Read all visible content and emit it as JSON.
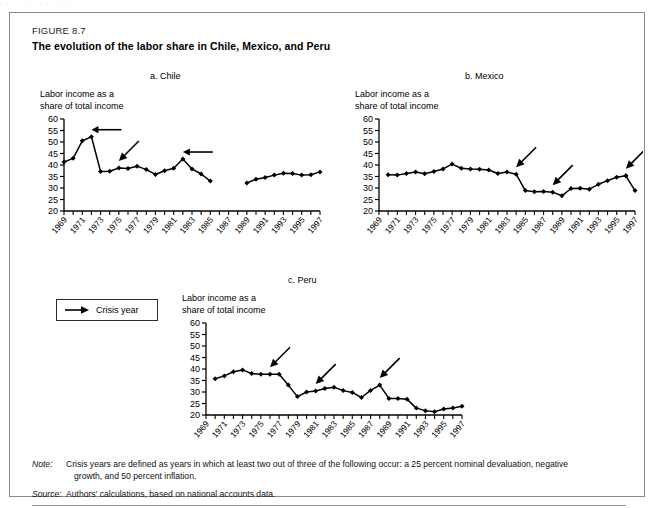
{
  "top_bleed_text": "·  ·  ·   ·   ·    ·      ·          ·                ·        ·     ·   ·  ·  ·",
  "figure": {
    "number_label": "FIGURE 8.7",
    "title": "The evolution of the labor share in Chile, Mexico, and Peru"
  },
  "axis_caption_line1": "Labor income as a",
  "axis_caption_line2": "share of total income",
  "legend": {
    "arrow_icon": "right-arrow-icon",
    "label": "Crisis year"
  },
  "notes": {
    "note_lead": "Note:",
    "note_text": "Crisis years are defined as years in which at least two out of three of the following occur: a 25 percent nominal devaluation, negative",
    "note_text_cont": "growth, and 50 percent inflation.",
    "source_lead": "Source:",
    "source_text": "Authors' calculations, based on national accounts data."
  },
  "chart_data": [
    {
      "type": "line",
      "title": "a. Chile",
      "xlabel": "",
      "ylabel": "Labor income as a share of total income",
      "ylim": [
        20,
        60
      ],
      "yticks": [
        20,
        25,
        30,
        35,
        40,
        45,
        50,
        55,
        60
      ],
      "xlim": [
        1969,
        1997
      ],
      "xticks": [
        1969,
        1970,
        1971,
        1972,
        1973,
        1974,
        1975,
        1976,
        1977,
        1978,
        1979,
        1980,
        1981,
        1982,
        1983,
        1984,
        1985,
        1986,
        1987,
        1988,
        1989,
        1990,
        1991,
        1992,
        1993,
        1994,
        1995,
        1996,
        1997
      ],
      "xticklabels": [
        "1969",
        "1971",
        "1973",
        "1975",
        "1977",
        "1979",
        "1981",
        "1983",
        "1985",
        "1987",
        "1989",
        "1991",
        "1993",
        "1995",
        "1997"
      ],
      "grid": false,
      "legend_position": "none",
      "marker": "diamond",
      "segments": [
        {
          "x": [
            1969,
            1970,
            1971,
            1972,
            1973,
            1974,
            1975,
            1976,
            1977,
            1978,
            1979,
            1980,
            1981,
            1982,
            1983,
            1984,
            1985
          ],
          "y": [
            41.3,
            42.9,
            50.5,
            52.3,
            37.2,
            37.3,
            38.7,
            38.5,
            39.5,
            38.0,
            35.9,
            37.5,
            38.6,
            42.6,
            38.3,
            36.1,
            33.0
          ]
        },
        {
          "x": [
            1989,
            1990,
            1991,
            1992,
            1993,
            1994,
            1995,
            1996,
            1997
          ],
          "y": [
            32.2,
            33.8,
            34.6,
            35.6,
            36.4,
            36.3,
            35.6,
            35.8,
            37.0
          ]
        }
      ],
      "annotations": [
        {
          "label": "crisis-year-arrow",
          "year": 1972,
          "style": "horizontal"
        },
        {
          "label": "crisis-year-arrow",
          "year": 1975,
          "style": "diagonal"
        },
        {
          "label": "crisis-year-arrow",
          "year": 1982,
          "style": "horizontal"
        }
      ]
    },
    {
      "type": "line",
      "title": "b. Mexico",
      "xlabel": "",
      "ylabel": "Labor income as a share of total income",
      "ylim": [
        20,
        60
      ],
      "yticks": [
        20,
        25,
        30,
        35,
        40,
        45,
        50,
        55,
        60
      ],
      "xlim": [
        1969,
        1997
      ],
      "xticklabels": [
        "1969",
        "1971",
        "1973",
        "1975",
        "1977",
        "1979",
        "1981",
        "1983",
        "1985",
        "1987",
        "1989",
        "1991",
        "1993",
        "1995",
        "1997"
      ],
      "grid": false,
      "legend_position": "none",
      "marker": "diamond",
      "segments": [
        {
          "x": [
            1970,
            1971,
            1972,
            1973,
            1974,
            1975,
            1976,
            1977,
            1978,
            1979,
            1980,
            1981,
            1982,
            1983,
            1984,
            1985,
            1986,
            1987,
            1988,
            1989,
            1990,
            1991,
            1992,
            1993,
            1994,
            1995,
            1996
          ],
          "y": [
            35.8,
            35.6,
            36.3,
            37.0,
            36.2,
            37.2,
            38.3,
            40.4,
            38.6,
            38.3,
            38.2,
            37.8,
            36.3,
            37.0,
            36.0,
            28.9,
            28.4,
            28.5,
            28.2,
            26.6,
            29.8,
            29.9,
            29.5,
            31.6,
            33.2,
            34.7,
            35.3
          ]
        },
        {
          "x": [
            1996,
            1997
          ],
          "y": [
            35.3,
            28.9
          ]
        }
      ],
      "annotations": [
        {
          "label": "crisis-year-arrow",
          "year": 1984,
          "style": "diagonal"
        },
        {
          "label": "crisis-year-arrow",
          "year": 1988,
          "style": "diagonal"
        },
        {
          "label": "crisis-year-arrow",
          "year": 1996,
          "style": "diagonal"
        }
      ]
    },
    {
      "type": "line",
      "title": "c. Peru",
      "xlabel": "",
      "ylabel": "Labor income as a share of total income",
      "ylim": [
        20,
        60
      ],
      "yticks": [
        20,
        25,
        30,
        35,
        40,
        45,
        50,
        55,
        60
      ],
      "xlim": [
        1969,
        1997
      ],
      "xticklabels": [
        "1969",
        "1971",
        "1973",
        "1975",
        "1977",
        "1979",
        "1981",
        "1983",
        "1985",
        "1987",
        "1989",
        "1991",
        "1993",
        "1995",
        "1997"
      ],
      "grid": false,
      "legend_position": "none",
      "marker": "diamond",
      "segments": [
        {
          "x": [
            1970,
            1971,
            1972,
            1973,
            1974,
            1975,
            1976,
            1977,
            1978,
            1979,
            1980,
            1981,
            1982,
            1983,
            1984,
            1985,
            1986,
            1987,
            1988,
            1989,
            1990,
            1991,
            1992,
            1993,
            1994,
            1995,
            1996,
            1997
          ],
          "y": [
            35.8,
            37.0,
            38.8,
            39.6,
            38.0,
            37.7,
            37.7,
            37.7,
            33.0,
            28.0,
            30.0,
            30.4,
            31.5,
            32.1,
            30.6,
            29.8,
            27.6,
            30.7,
            33.0,
            27.2,
            27.2,
            26.8,
            23.0,
            21.9,
            21.4,
            22.6,
            23.0,
            23.8
          ]
        }
      ],
      "annotations": [
        {
          "label": "crisis-year-arrow",
          "year": 1976,
          "style": "diagonal"
        },
        {
          "label": "crisis-year-arrow",
          "year": 1981,
          "style": "diagonal"
        },
        {
          "label": "crisis-year-arrow",
          "year": 1988,
          "style": "diagonal"
        }
      ]
    }
  ]
}
